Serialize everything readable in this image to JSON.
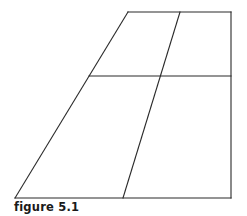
{
  "caption": "figure 5.1",
  "diagram": {
    "stroke_color": "#2a2a2a",
    "outline": {
      "top_left": [
        128,
        12
      ],
      "top_right": [
        231,
        12
      ],
      "bottom_right": [
        231,
        198
      ],
      "bottom_left": [
        15,
        198
      ]
    },
    "horizontal_divider": {
      "y": 76,
      "x_start": 89,
      "x_end": 231
    },
    "slanted_divider": {
      "top": [
        180,
        12
      ],
      "bottom": [
        123,
        198
      ]
    }
  }
}
